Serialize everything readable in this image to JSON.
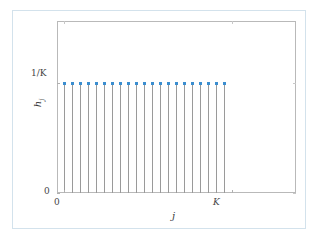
{
  "figure": {
    "background_color": "#ffffff",
    "outer_border_color": "#d3e2ec",
    "axes_border_color": "#b9b9b9"
  },
  "chart_data": {
    "type": "line",
    "plot_style": "stem",
    "title": "",
    "subtitle": "",
    "xlabel": "j",
    "ylabel": "h_j",
    "ylabel_base": "h",
    "ylabel_sub": "j",
    "grid": false,
    "legend": null,
    "marker_color": "#3b8ed0",
    "marker_shape": "square",
    "stem_color": "#9a9a9a",
    "xlim": [
      -0.9,
      29.0
    ],
    "ylim": [
      0,
      1.56
    ],
    "xticks": [
      0,
      21
    ],
    "xticklabels": [
      "0",
      "K"
    ],
    "yticks": [
      0,
      1
    ],
    "yticklabels": [
      "0",
      "1/K"
    ],
    "x": [
      0,
      1,
      2,
      3,
      4,
      5,
      6,
      7,
      8,
      9,
      10,
      11,
      12,
      13,
      14,
      15,
      16,
      17,
      18,
      19,
      20
    ],
    "values": [
      1,
      1,
      1,
      1,
      1,
      1,
      1,
      1,
      1,
      1,
      1,
      1,
      1,
      1,
      1,
      1,
      1,
      1,
      1,
      1,
      1
    ],
    "value_label": "1/K",
    "n_points": 21
  }
}
